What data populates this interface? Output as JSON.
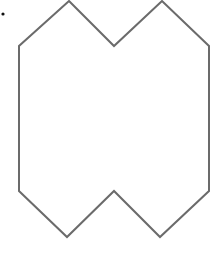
{
  "diagram": {
    "type": "polygon",
    "stroke_color": "#6b6b6b",
    "stroke_width": 2,
    "fill": "#ffffff",
    "vertices": [
      {
        "x": 69,
        "y": 1
      },
      {
        "x": 114,
        "y": 46
      },
      {
        "x": 162,
        "y": 1
      },
      {
        "x": 209,
        "y": 46
      },
      {
        "x": 209,
        "y": 191
      },
      {
        "x": 160,
        "y": 237
      },
      {
        "x": 114,
        "y": 191
      },
      {
        "x": 67,
        "y": 237
      },
      {
        "x": 19,
        "y": 191
      },
      {
        "x": 19,
        "y": 46
      }
    ],
    "marker_dot": {
      "x": 3,
      "y": 14,
      "r": 1.6,
      "color": "#111111"
    }
  }
}
